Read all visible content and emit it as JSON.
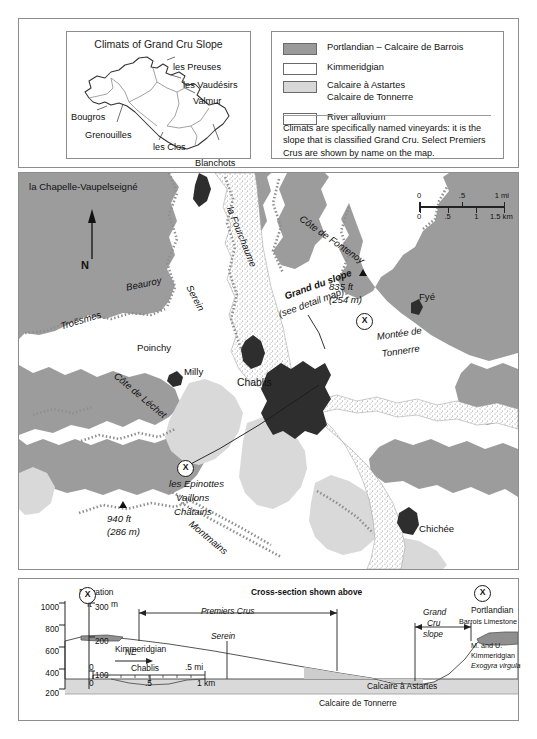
{
  "inset": {
    "title": "Climats of Grand Cru Slope",
    "climats": [
      {
        "name": "les Preuses",
        "x": 106,
        "y": 12
      },
      {
        "name": "les Vaudésirs",
        "x": 116,
        "y": 30
      },
      {
        "name": "Valmur",
        "x": 126,
        "y": 46
      },
      {
        "name": "Bougros",
        "x": 4,
        "y": 62
      },
      {
        "name": "Grenouilles",
        "x": 18,
        "y": 80
      },
      {
        "name": "les Clos",
        "x": 86,
        "y": 92
      },
      {
        "name": "Blanchots",
        "x": 128,
        "y": 108
      }
    ]
  },
  "legend": {
    "rows": [
      {
        "swatch": "portlandian",
        "lines": [
          "Portlandian – Calcaire de Barrois"
        ]
      },
      {
        "swatch": "kimmeridgian",
        "lines": [
          "Kimmeridgian"
        ]
      },
      {
        "swatch": "astartes",
        "lines": [
          "Calcaire à Astartes",
          "Calcaire de Tonnerre"
        ]
      },
      {
        "swatch": "alluvium",
        "lines": [
          "River alluvium"
        ]
      }
    ],
    "note": "Climats are specifically named vineyards: it is the slope that is classified Grand Cru. Select Premiers Crus are shown by name on the map."
  },
  "map": {
    "north_label": "N",
    "scale": {
      "miles": {
        "ticks": [
          "0",
          ".5",
          "1 mi"
        ]
      },
      "km": {
        "ticks": [
          "0",
          ".5",
          "1",
          "1.5 km"
        ]
      }
    },
    "places": [
      {
        "label": "la Chapelle-Vaupelseigné",
        "x": 10,
        "y": 8,
        "style": "plain"
      },
      {
        "label": "Beauroy",
        "x": 106,
        "y": 109,
        "style": "italic",
        "rot": -12
      },
      {
        "label": "Troësmes",
        "x": 40,
        "y": 148,
        "style": "italic",
        "rot": -17
      },
      {
        "label": "Poinchy",
        "x": 118,
        "y": 169,
        "style": "plain"
      },
      {
        "label": "Serein",
        "x": 175,
        "y": 110,
        "style": "italic",
        "rot": 62
      },
      {
        "label": "la Fourchaume",
        "x": 216,
        "y": 32,
        "style": "italic",
        "rot": 68
      },
      {
        "label": "Côte de Fontenoy",
        "x": 285,
        "y": 40,
        "style": "italic",
        "rot": 35
      },
      {
        "label": "Côte de Léchet",
        "x": 100,
        "y": 197,
        "style": "italic",
        "rot": 40
      },
      {
        "label": "Milly",
        "x": 165,
        "y": 193,
        "style": "plain"
      },
      {
        "label": "Chablis",
        "x": 218,
        "y": 204,
        "style": "big"
      },
      {
        "label": "Fyé",
        "x": 400,
        "y": 118,
        "style": "plain"
      },
      {
        "label": "Montée de",
        "x": 357,
        "y": 158,
        "style": "italic",
        "rot": -8
      },
      {
        "label": "Tonnerre",
        "x": 362,
        "y": 175,
        "style": "italic",
        "rot": -8
      },
      {
        "label": "les Epinottes",
        "x": 150,
        "y": 305,
        "style": "italic"
      },
      {
        "label": "Vaillons",
        "x": 157,
        "y": 319,
        "style": "italic"
      },
      {
        "label": "Châtains",
        "x": 155,
        "y": 333,
        "style": "italic"
      },
      {
        "label": "Montmains",
        "x": 175,
        "y": 345,
        "style": "italic",
        "rot": 40
      },
      {
        "label": "Chichée",
        "x": 400,
        "y": 350,
        "style": "plain"
      }
    ],
    "callout": {
      "line1": "Grand du slope",
      "line2": "(see detail map)"
    },
    "summits": [
      {
        "ft": "835 ft",
        "m": "(254 m)",
        "x": 310,
        "y": 108
      },
      {
        "ft": "940 ft",
        "m": "(286 m)",
        "x": 88,
        "y": 340
      }
    ],
    "x_marker": "X"
  },
  "cross_section": {
    "title": "Cross-section shown above",
    "x_marker": "X",
    "axis": {
      "title": "Elevation",
      "unit_ft": "ft",
      "unit_m": "m",
      "ft_ticks": [
        "1000",
        "800",
        "600",
        "400",
        "200"
      ],
      "m_ticks": [
        "300",
        "200",
        "100"
      ]
    },
    "scale": {
      "miles": [
        "0",
        ".5 mi"
      ],
      "km": [
        "0",
        ".5",
        "1 km"
      ]
    },
    "direction": "NE",
    "brackets": [
      {
        "label": "Premiers Crus"
      },
      {
        "label_lines": [
          "Grand",
          "Cru",
          "slope"
        ]
      }
    ],
    "strata": [
      {
        "label": "Kimmeridgian"
      },
      {
        "label": "Portlandian"
      },
      {
        "label": "Barrois Limestone"
      },
      {
        "label_lines": [
          "M. and U.",
          "Kimmeridgian",
          "Exogyra virgula"
        ]
      },
      {
        "label": "Calcaire à Astartes"
      },
      {
        "label": "Calcaire de Tonnerre"
      }
    ],
    "markers": [
      {
        "label": "Serein"
      },
      {
        "label": "Chablis"
      }
    ]
  },
  "colors": {
    "portlandian": "#9a9a9a",
    "kimmeridgian": "#ffffff",
    "astartes": "#d8d8d8",
    "alluvium_dot": "#777777",
    "town": "#2b2b2b",
    "ink": "#1a1a1a",
    "panel_border": "#8d8d8d"
  },
  "chart_data": {
    "type": "area",
    "title": "Cross-section shown above",
    "xlabel": "",
    "ylabel": "Elevation",
    "ylim": [
      200,
      1000
    ],
    "y_ticks_ft": [
      200,
      400,
      600,
      800,
      1000
    ],
    "y_ticks_m": [
      100,
      200,
      300
    ],
    "x_range_km": [
      0,
      1
    ],
    "series": [
      {
        "name": "Ground surface (SW → NE profile)",
        "x_px": [
          62,
          88,
          110,
          150,
          195,
          240,
          285,
          320,
          352,
          372,
          392,
          404,
          415,
          430,
          446,
          458,
          470,
          486
        ],
        "elevation_ft": [
          800,
          800,
          790,
          760,
          720,
          660,
          600,
          545,
          500,
          430,
          420,
          420,
          440,
          520,
          640,
          760,
          810,
          815
        ]
      }
    ],
    "annotations": [
      {
        "text": "Premiers Crus",
        "type": "bracket",
        "x_start_px": 120,
        "x_end_px": 320
      },
      {
        "text": "Grand Cru slope",
        "type": "bracket",
        "x_start_px": 395,
        "x_end_px": 455
      },
      {
        "text": "Kimmeridgian",
        "type": "stratum"
      },
      {
        "text": "Portlandian",
        "type": "stratum"
      },
      {
        "text": "Barrois Limestone",
        "type": "stratum"
      },
      {
        "text": "M. and U. Kimmeridgian",
        "type": "stratum"
      },
      {
        "text": "Exogyra virgula",
        "type": "fossil"
      },
      {
        "text": "Calcaire à Astartes",
        "type": "stratum"
      },
      {
        "text": "Calcaire de Tonnerre",
        "type": "stratum"
      },
      {
        "text": "Serein",
        "type": "river-marker"
      },
      {
        "text": "Chablis",
        "type": "town-marker"
      },
      {
        "text": "NE",
        "type": "direction-arrow"
      }
    ]
  }
}
